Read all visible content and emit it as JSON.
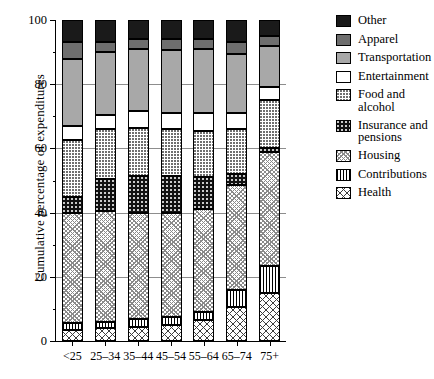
{
  "chart_data": {
    "type": "bar",
    "subtype": "stacked-bar-cumulative-percentage",
    "title": "",
    "xlabel": "",
    "ylabel": "Cumulative percentage of expenditures",
    "ylim": [
      0,
      100
    ],
    "yticks": [
      0,
      20,
      40,
      60,
      80,
      100
    ],
    "ytick_labels": [
      "0",
      "20",
      "40",
      "60",
      "80",
      "100"
    ],
    "grid": true,
    "grid_axis": "y",
    "legend_position": "right",
    "categories": [
      "<25",
      "25–34",
      "35–44",
      "45–54",
      "55–64",
      "65–74",
      "75+"
    ],
    "series": [
      {
        "name": "Health",
        "key": "health",
        "values": [
          3.5,
          4.0,
          4.5,
          5.0,
          6.5,
          10.5,
          15.0
        ]
      },
      {
        "name": "Contributions",
        "key": "contrib",
        "values": [
          2.0,
          2.0,
          2.5,
          2.5,
          2.5,
          5.5,
          8.5
        ]
      },
      {
        "name": "Housing",
        "key": "housing",
        "values": [
          34.5,
          34.5,
          33.0,
          32.5,
          32.0,
          32.5,
          35.5
        ]
      },
      {
        "name": "Insurance and pensions",
        "key": "insurance",
        "values": [
          5.0,
          10.0,
          11.5,
          11.5,
          10.0,
          3.5,
          1.0
        ]
      },
      {
        "name": "Food and alcohol",
        "key": "food",
        "values": [
          17.5,
          15.5,
          15.0,
          14.5,
          14.5,
          14.0,
          15.0
        ]
      },
      {
        "name": "Entertainment",
        "key": "entertain",
        "values": [
          4.5,
          4.5,
          5.0,
          5.0,
          5.5,
          5.0,
          4.0
        ]
      },
      {
        "name": "Transportation",
        "key": "transport",
        "values": [
          21.0,
          19.5,
          19.5,
          19.5,
          20.0,
          18.5,
          13.0
        ]
      },
      {
        "name": "Apparel",
        "key": "apparel",
        "values": [
          5.0,
          3.0,
          3.0,
          3.5,
          3.0,
          3.5,
          3.0
        ]
      },
      {
        "name": "Other",
        "key": "other",
        "values": [
          7.0,
          7.0,
          6.0,
          6.0,
          6.0,
          7.0,
          5.0
        ]
      }
    ],
    "stack_order_bottom_to_top": [
      "Health",
      "Contributions",
      "Housing",
      "Insurance and pensions",
      "Food and alcohol",
      "Entertainment",
      "Transportation",
      "Apparel",
      "Other"
    ],
    "cumulative_breakpoints": {
      "<25": [
        3.5,
        5.5,
        40.0,
        45.0,
        62.5,
        67.0,
        88.0,
        93.0,
        100
      ],
      "25–34": [
        4.0,
        6.0,
        40.5,
        50.5,
        66.0,
        70.5,
        90.0,
        93.0,
        100
      ],
      "35–44": [
        4.5,
        7.0,
        40.0,
        51.5,
        66.5,
        71.5,
        91.0,
        94.0,
        100
      ],
      "45–54": [
        5.0,
        7.5,
        40.0,
        51.5,
        66.0,
        71.0,
        90.5,
        94.0,
        100
      ],
      "55–64": [
        6.5,
        9.0,
        41.0,
        51.0,
        65.5,
        71.0,
        91.0,
        94.0,
        100
      ],
      "65–74": [
        10.5,
        16.0,
        48.5,
        52.0,
        66.0,
        71.0,
        89.5,
        93.0,
        100
      ],
      "75+": [
        15.0,
        23.5,
        59.0,
        60.0,
        75.0,
        79.0,
        92.0,
        95.0,
        100
      ]
    }
  },
  "legend": {
    "items": [
      {
        "label": "Other",
        "swatch": "solid-black-swatch"
      },
      {
        "label": "Apparel",
        "swatch": "dark-gray-swatch"
      },
      {
        "label": "Transportation",
        "swatch": "light-gray-swatch"
      },
      {
        "label": "Entertainment",
        "swatch": "white-swatch"
      },
      {
        "label": "Food and alcohol",
        "swatch": "fine-dots-swatch"
      },
      {
        "label": "Insurance and\npensions",
        "swatch": "black-dots-swatch"
      },
      {
        "label": "Housing",
        "swatch": "fine-crosshatch-swatch"
      },
      {
        "label": "Contributions",
        "swatch": "vertical-lines-swatch"
      },
      {
        "label": "Health",
        "swatch": "coarse-crosshatch-swatch"
      }
    ]
  }
}
